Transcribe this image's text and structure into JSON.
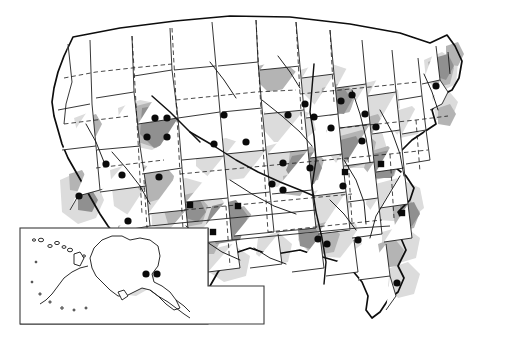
{
  "figure": {
    "name": "united-states-distribution-map",
    "kind": "thematic-choropleth-point-map",
    "background_color": "#ffffff",
    "width": 510,
    "height": 340
  },
  "chart_data": {
    "type": "map",
    "title": "",
    "subtitle": "",
    "xlabel": "",
    "ylabel": "",
    "projection_note": "conterminous United States with Alaska and Hawaii inset",
    "grid": false,
    "legend_position": "none",
    "legend_entries": [
      {
        "symbol": "circle",
        "label": "",
        "color": "#0a0a0a"
      },
      {
        "symbol": "square",
        "label": "",
        "color": "#0a0a0a"
      },
      {
        "symbol": "triangle",
        "label": "",
        "color": "#0a0a0a"
      }
    ],
    "shading_classes": [
      {
        "name": "light",
        "color": "#dcdcdc",
        "label": ""
      },
      {
        "name": "moderate",
        "color": "#b4b4b4",
        "label": ""
      },
      {
        "name": "high",
        "color": "#909090",
        "label": ""
      }
    ],
    "counts": {
      "circle_markers": 31,
      "square_markers": 6,
      "triangle_markers": 1,
      "inset_markers": 2,
      "total_markers": 40
    },
    "markers": [
      {
        "symbol": "circle",
        "x": 155,
        "y": 118
      },
      {
        "symbol": "circle",
        "x": 147,
        "y": 137
      },
      {
        "symbol": "circle",
        "x": 167,
        "y": 137
      },
      {
        "symbol": "circle",
        "x": 106,
        "y": 164
      },
      {
        "symbol": "circle",
        "x": 159,
        "y": 177
      },
      {
        "symbol": "circle",
        "x": 128,
        "y": 221
      },
      {
        "symbol": "circle",
        "x": 214,
        "y": 144
      },
      {
        "symbol": "circle",
        "x": 246,
        "y": 142
      },
      {
        "symbol": "circle",
        "x": 283,
        "y": 163
      },
      {
        "symbol": "circle",
        "x": 272,
        "y": 184
      },
      {
        "symbol": "circle",
        "x": 283,
        "y": 190
      },
      {
        "symbol": "circle",
        "x": 305,
        "y": 104
      },
      {
        "symbol": "circle",
        "x": 314,
        "y": 117
      },
      {
        "symbol": "circle",
        "x": 341,
        "y": 101
      },
      {
        "symbol": "circle",
        "x": 310,
        "y": 168
      },
      {
        "symbol": "circle",
        "x": 343,
        "y": 186
      },
      {
        "symbol": "circle",
        "x": 362,
        "y": 141
      },
      {
        "symbol": "circle",
        "x": 365,
        "y": 114
      },
      {
        "symbol": "circle",
        "x": 436,
        "y": 86
      },
      {
        "symbol": "circle",
        "x": 318,
        "y": 239
      },
      {
        "symbol": "circle",
        "x": 327,
        "y": 244
      },
      {
        "symbol": "circle",
        "x": 358,
        "y": 240
      },
      {
        "symbol": "circle",
        "x": 397,
        "y": 283
      },
      {
        "symbol": "circle",
        "x": 122,
        "y": 175
      },
      {
        "symbol": "circle",
        "x": 79,
        "y": 196
      },
      {
        "symbol": "circle",
        "x": 167,
        "y": 118
      },
      {
        "symbol": "circle",
        "x": 288,
        "y": 115
      },
      {
        "symbol": "circle",
        "x": 331,
        "y": 128
      },
      {
        "symbol": "circle",
        "x": 352,
        "y": 95
      },
      {
        "symbol": "circle",
        "x": 376,
        "y": 127
      },
      {
        "symbol": "circle",
        "x": 224,
        "y": 115
      },
      {
        "symbol": "square",
        "x": 238,
        "y": 206
      },
      {
        "symbol": "square",
        "x": 213,
        "y": 232
      },
      {
        "symbol": "square",
        "x": 190,
        "y": 205
      },
      {
        "symbol": "square",
        "x": 381,
        "y": 164
      },
      {
        "symbol": "square",
        "x": 402,
        "y": 213
      },
      {
        "symbol": "square",
        "x": 345,
        "y": 172
      },
      {
        "symbol": "triangle",
        "x": 193,
        "y": 243
      }
    ]
  },
  "inset": {
    "name": "alaska-hawaii-inset",
    "label": "",
    "frame_color": "#3a3a3a",
    "markers": [
      {
        "symbol": "circle",
        "x": 146,
        "y": 274
      },
      {
        "symbol": "circle",
        "x": 157,
        "y": 274
      }
    ]
  }
}
